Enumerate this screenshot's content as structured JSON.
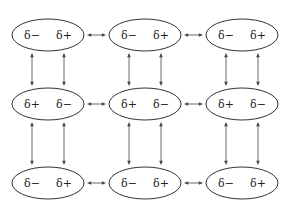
{
  "diagram": {
    "colors": {
      "stroke": "#333333",
      "text": "#222222",
      "background": "#ffffff"
    },
    "layout": {
      "col_x": [
        48,
        145,
        242
      ],
      "row_y": [
        35,
        104,
        183
      ],
      "ellipse_rx": 36,
      "ellipse_ry": 16,
      "label_dx": 16
    },
    "rows": [
      {
        "molecules": [
          {
            "left": "δ−",
            "right": "δ+"
          },
          {
            "left": "δ−",
            "right": "δ+"
          },
          {
            "left": "δ−",
            "right": "δ+"
          }
        ]
      },
      {
        "molecules": [
          {
            "left": "δ+",
            "right": "δ−"
          },
          {
            "left": "δ+",
            "right": "δ−"
          },
          {
            "left": "δ+",
            "right": "δ−"
          }
        ]
      },
      {
        "molecules": [
          {
            "left": "δ−",
            "right": "δ+"
          },
          {
            "left": "δ−",
            "right": "δ+"
          },
          {
            "left": "δ−",
            "right": "δ+"
          }
        ]
      }
    ],
    "connections": {
      "horizontal": "double-headed arrows between adjacent molecules in each row",
      "vertical": "two double-headed arrows between vertically adjacent molecules (aligned with left and right charges)"
    }
  }
}
